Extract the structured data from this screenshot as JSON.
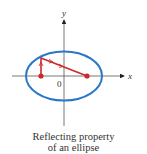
{
  "diagram": {
    "x_axis_label": "x",
    "y_axis_label": "y",
    "origin_label": "0",
    "colors": {
      "ellipse": "#2a77c9",
      "ray": "#cc2a2a",
      "axis": "#555555"
    }
  },
  "caption": {
    "line1": "Reflecting property",
    "line2": "of an ellipse"
  }
}
